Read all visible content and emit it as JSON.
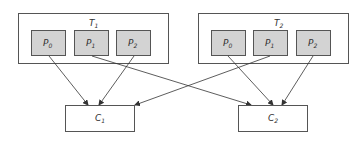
{
  "diagram": {
    "type": "topic-partition-consumer",
    "colors": {
      "stroke": "#555555",
      "partition_fill": "#d3d3d3",
      "box_fill": "#ffffff",
      "line": "#333333"
    },
    "topics": [
      {
        "id": "T1",
        "label": "T",
        "sub": "1",
        "partitions": [
          {
            "label": "P",
            "sub": "0"
          },
          {
            "label": "P",
            "sub": "1"
          },
          {
            "label": "P",
            "sub": "2"
          }
        ]
      },
      {
        "id": "T2",
        "label": "T",
        "sub": "2",
        "partitions": [
          {
            "label": "P",
            "sub": "0"
          },
          {
            "label": "P",
            "sub": "1"
          },
          {
            "label": "P",
            "sub": "2"
          }
        ]
      }
    ],
    "consumers": [
      {
        "id": "C1",
        "label": "C",
        "sub": "1"
      },
      {
        "id": "C2",
        "label": "C",
        "sub": "2"
      }
    ],
    "edges": [
      {
        "from": "T1.P0",
        "to": "C1"
      },
      {
        "from": "T1.P1",
        "to": "C2"
      },
      {
        "from": "T1.P2",
        "to": "C1"
      },
      {
        "from": "T2.P0",
        "to": "C2"
      },
      {
        "from": "T2.P1",
        "to": "C1"
      },
      {
        "from": "T2.P2",
        "to": "C2"
      }
    ]
  }
}
